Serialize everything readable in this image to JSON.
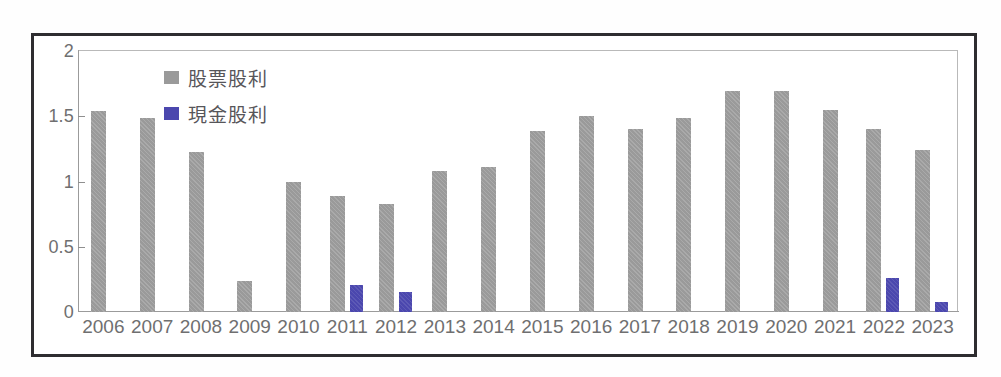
{
  "chart_data": {
    "type": "bar",
    "title": "",
    "subtitle": "",
    "xlabel": "",
    "ylabel": "",
    "ylim": [
      0,
      2
    ],
    "yticks": [
      "0",
      "0.5",
      "1",
      "1.5",
      "2"
    ],
    "ytick_values": [
      0,
      0.5,
      1,
      1.5,
      2
    ],
    "grid": false,
    "legend_position": "top-left-inside",
    "categories": [
      "2006",
      "2007",
      "2008",
      "2009",
      "2010",
      "2011",
      "2012",
      "2013",
      "2014",
      "2015",
      "2016",
      "2017",
      "2018",
      "2019",
      "2020",
      "2021",
      "2022",
      "2023"
    ],
    "series": [
      {
        "name": "股票股利",
        "color": "#9a9a9a",
        "values": [
          1.54,
          1.49,
          1.23,
          0.24,
          1.0,
          0.89,
          0.83,
          1.08,
          1.11,
          1.39,
          1.5,
          1.4,
          1.49,
          1.69,
          1.69,
          1.55,
          1.4,
          1.24
        ]
      },
      {
        "name": "現金股利",
        "color": "#4b47ae",
        "values": [
          0,
          0,
          0,
          0,
          0,
          0.21,
          0.15,
          0,
          0,
          0,
          0,
          0,
          0,
          0,
          0,
          0,
          0.26,
          0.08
        ]
      }
    ]
  },
  "legend": {
    "items": [
      {
        "label": "股票股利",
        "color": "#9a9a9a"
      },
      {
        "label": "現金股利",
        "color": "#4b47ae"
      }
    ]
  },
  "colors": {
    "stock_dividend": "#9a9a9a",
    "cash_dividend": "#4b47ae",
    "axis": "#9b9b9b",
    "tick_text": "#6f6f70",
    "frame": "#2e2d30",
    "plot_border": "#b9b9b9",
    "background": "#ffffff"
  }
}
